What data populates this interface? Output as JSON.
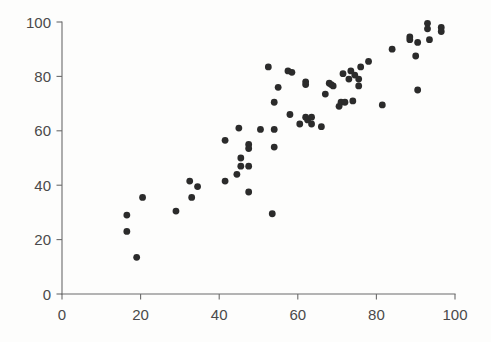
{
  "chart_data": {
    "type": "scatter",
    "title": "",
    "subtitle": "",
    "xlabel": "",
    "ylabel": "",
    "xlim": [
      0,
      100
    ],
    "ylim": [
      0,
      100
    ],
    "grid": false,
    "legend": null,
    "marker": {
      "shape": "circle",
      "color": "#2b2b2b",
      "size_px": 4.4
    },
    "axis_color": "#6b6b6b",
    "tick_label_color": "#4a4a4a",
    "background_color": "#fdfdfc",
    "xticks": [
      0,
      20,
      40,
      60,
      80,
      100
    ],
    "xtick_labels": [
      "0",
      "20",
      "40",
      "60",
      "80",
      "100"
    ],
    "yticks": [
      0,
      20,
      40,
      60,
      80,
      100
    ],
    "ytick_labels": [
      "0",
      "20",
      "40",
      "60",
      "80",
      "100"
    ],
    "n_points": 79,
    "points": [
      [
        16.5,
        29.0
      ],
      [
        16.5,
        23.0
      ],
      [
        19.0,
        13.5
      ],
      [
        20.5,
        35.5
      ],
      [
        29.0,
        30.5
      ],
      [
        32.5,
        41.5
      ],
      [
        33.0,
        35.5
      ],
      [
        34.5,
        39.5
      ],
      [
        41.5,
        56.5
      ],
      [
        41.5,
        41.5
      ],
      [
        44.5,
        44.0
      ],
      [
        45.0,
        61.0
      ],
      [
        45.5,
        47.0
      ],
      [
        45.5,
        50.0
      ],
      [
        47.5,
        55.0
      ],
      [
        47.5,
        53.5
      ],
      [
        47.5,
        37.5
      ],
      [
        47.5,
        47.0
      ],
      [
        50.5,
        60.5
      ],
      [
        52.5,
        83.5
      ],
      [
        53.5,
        29.5
      ],
      [
        54.0,
        54.0
      ],
      [
        54.0,
        60.5
      ],
      [
        54.0,
        70.5
      ],
      [
        55.0,
        76.0
      ],
      [
        57.5,
        82.0
      ],
      [
        58.0,
        66.0
      ],
      [
        58.5,
        81.5
      ],
      [
        60.5,
        62.5
      ],
      [
        62.0,
        78.0
      ],
      [
        62.0,
        77.0
      ],
      [
        62.0,
        65.0
      ],
      [
        62.5,
        64.0
      ],
      [
        63.5,
        65.0
      ],
      [
        63.5,
        62.5
      ],
      [
        66.0,
        61.5
      ],
      [
        67.0,
        73.5
      ],
      [
        68.0,
        77.5
      ],
      [
        68.5,
        77.0
      ],
      [
        69.0,
        76.5
      ],
      [
        70.5,
        69.0
      ],
      [
        71.0,
        70.5
      ],
      [
        71.5,
        81.0
      ],
      [
        72.0,
        70.5
      ],
      [
        73.0,
        79.0
      ],
      [
        73.5,
        82.0
      ],
      [
        74.0,
        71.0
      ],
      [
        74.5,
        80.5
      ],
      [
        75.5,
        76.5
      ],
      [
        75.5,
        79.0
      ],
      [
        76.0,
        83.5
      ],
      [
        78.0,
        85.5
      ],
      [
        81.5,
        69.5
      ],
      [
        84.0,
        90.0
      ],
      [
        88.5,
        94.5
      ],
      [
        88.5,
        93.5
      ],
      [
        90.0,
        87.5
      ],
      [
        90.5,
        92.5
      ],
      [
        90.5,
        75.0
      ],
      [
        93.0,
        99.5
      ],
      [
        93.0,
        97.5
      ],
      [
        93.5,
        93.5
      ],
      [
        96.5,
        98.0
      ],
      [
        96.5,
        96.5
      ]
    ]
  }
}
